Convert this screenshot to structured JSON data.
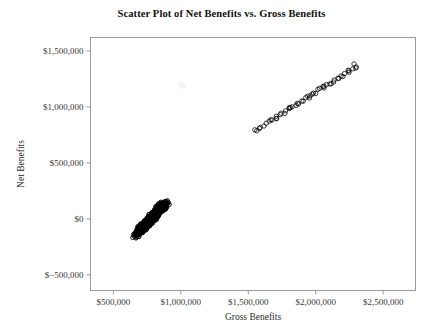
{
  "chart_data": {
    "type": "scatter",
    "title": "Scatter Plot of Net Benefits vs. Gross Benefits",
    "xlabel": "Gross Benefits",
    "ylabel": "Net Benefits",
    "xlim": [
      330000,
      2740000
    ],
    "ylim": [
      -640000,
      1620000
    ],
    "xticks": [
      500000,
      1000000,
      1500000,
      2000000,
      2500000
    ],
    "xtick_labels": [
      "$500,000",
      "$1,000,000",
      "$1,500,000",
      "$2,000,000",
      "$2,500,000"
    ],
    "yticks": [
      -500000,
      0,
      500000,
      1000000,
      1500000
    ],
    "ytick_labels": [
      "$−500,000",
      "$0",
      "$500,000",
      "$1,000,000",
      "$1,500,000"
    ],
    "grid": false,
    "legend": null,
    "marker": "open-circle",
    "marker_color": "#000000",
    "series": [
      {
        "name": "Low cluster",
        "x": [
          660000,
          668000,
          674000,
          681000,
          686000,
          690000,
          694000,
          698000,
          702000,
          706000,
          710000,
          713000,
          716000,
          719000,
          722000,
          725000,
          728000,
          731000,
          734000,
          737000,
          740000,
          742000,
          745000,
          748000,
          750000,
          753000,
          755000,
          758000,
          760000,
          763000,
          765000,
          768000,
          770000,
          772000,
          775000,
          777000,
          780000,
          782000,
          785000,
          787000,
          790000,
          792000,
          795000,
          797000,
          800000,
          802000,
          805000,
          807000,
          810000,
          812000,
          815000,
          818000,
          820000,
          823000,
          826000,
          829000,
          832000,
          835000,
          838000,
          841000,
          845000,
          849000,
          853000,
          857000,
          862000,
          867000,
          872000,
          878000,
          885000,
          893000,
          672000,
          684000,
          696000,
          708000,
          717000,
          726000,
          735000,
          744000,
          752000,
          761000,
          769000,
          778000,
          786000,
          794000,
          803000,
          811000,
          819000,
          828000,
          837000,
          848000,
          859000,
          871000,
          700000,
          730000,
          757000,
          781000,
          806000,
          830000,
          856000,
          880000
        ],
        "y": [
          -150000,
          -142000,
          -136000,
          -129000,
          -123000,
          -118000,
          -113000,
          -108000,
          -103000,
          -98000,
          -94000,
          -90000,
          -86000,
          -82000,
          -79000,
          -75000,
          -71000,
          -68000,
          -64000,
          -61000,
          -57000,
          -54000,
          -51000,
          -47000,
          -44000,
          -41000,
          -38000,
          -34000,
          -31000,
          -28000,
          -25000,
          -21000,
          -18000,
          -15000,
          -12000,
          -9000,
          -5000,
          -2000,
          1000,
          4000,
          8000,
          11000,
          15000,
          18000,
          22000,
          25000,
          29000,
          32000,
          36000,
          39000,
          43000,
          47000,
          50000,
          54000,
          58000,
          62000,
          66000,
          70000,
          74000,
          78000,
          83000,
          88000,
          93000,
          98000,
          104000,
          110000,
          116000,
          124000,
          132000,
          142000,
          -130000,
          -112000,
          -96000,
          -82000,
          -70000,
          -58000,
          -46000,
          -34000,
          -23000,
          -12000,
          -1000,
          10000,
          21000,
          32000,
          44000,
          55000,
          66000,
          78000,
          91000,
          106000,
          120000,
          137000,
          -88000,
          -52000,
          -20000,
          9000,
          41000,
          72000,
          105000,
          136000
        ]
      },
      {
        "name": "High cluster",
        "x": [
          1545000,
          1560000,
          1578000,
          1596000,
          1612000,
          1628000,
          1648000,
          1666000,
          1682000,
          1700000,
          1716000,
          1732000,
          1748000,
          1762000,
          1778000,
          1796000,
          1812000,
          1828000,
          1844000,
          1858000,
          1874000,
          1890000,
          1906000,
          1922000,
          1938000,
          1954000,
          1970000,
          1986000,
          2002000,
          2018000,
          2034000,
          2050000,
          2066000,
          2082000,
          2098000,
          2114000,
          2130000,
          2148000,
          2166000,
          2184000,
          2202000,
          2220000,
          2238000,
          2256000,
          2272000,
          2290000,
          2306000,
          1700000,
          1820000,
          1950000,
          2060000,
          2180000,
          2250000,
          2285000
        ],
        "y": [
          790000,
          800000,
          812000,
          826000,
          838000,
          850000,
          864000,
          878000,
          890000,
          904000,
          916000,
          928000,
          940000,
          951000,
          963000,
          977000,
          989000,
          1001000,
          1013000,
          1024000,
          1036000,
          1048000,
          1060000,
          1072000,
          1084000,
          1096000,
          1108000,
          1120000,
          1132000,
          1144000,
          1156000,
          1168000,
          1180000,
          1192000,
          1204000,
          1216000,
          1228000,
          1242000,
          1256000,
          1270000,
          1284000,
          1298000,
          1312000,
          1326000,
          1338000,
          1352000,
          1364000,
          898000,
          995000,
          1089000,
          1174000,
          1266000,
          1320000,
          1392000
        ]
      }
    ]
  },
  "axes": {
    "frame_color": "#9a9a9a"
  }
}
